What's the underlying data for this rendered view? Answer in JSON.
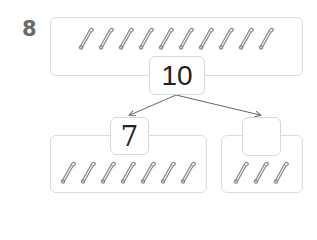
{
  "problem_number": "8",
  "whole": {
    "value": "10",
    "pin_count": 10
  },
  "left_part": {
    "value": "7",
    "pin_count": 7
  },
  "right_part": {
    "value": "",
    "pin_count": 3
  },
  "icons": {
    "pin": "safety-pin-icon"
  },
  "colors": {
    "border": "#dcdcdc",
    "pin": "#8a8a8a",
    "arrow": "#666666",
    "text": "#222222"
  }
}
